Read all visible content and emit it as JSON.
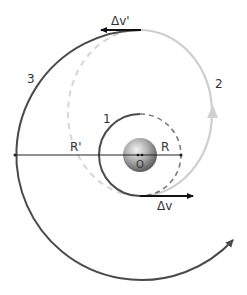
{
  "diagram": {
    "type": "hohmann-transfer-orbit",
    "labels": {
      "orbit_1": "1",
      "orbit_2": "2",
      "orbit_3": "3",
      "delta_v": "Δv",
      "delta_v_prime": "Δv'",
      "radius_inner": "R",
      "radius_outer": "R'",
      "center": "O"
    },
    "colors": {
      "inner_orbit": "#4a4a4a",
      "transfer_orbit": "#cccccc",
      "outer_orbit": "#4a4a4a",
      "arrow": "#111111",
      "planet_light": "#e8e8e8",
      "planet_dark": "#6e6e6e"
    }
  }
}
